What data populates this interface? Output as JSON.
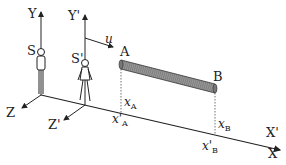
{
  "diagram": {
    "type": "relativity-frames-rod",
    "labels": {
      "Y": "Y",
      "Y_prime": "Y'",
      "S": "S",
      "S_prime": "S'",
      "u": "u",
      "A": "A",
      "B": "B",
      "Z": "Z",
      "Z_prime": "Z'",
      "X": "X",
      "X_prime": "X'",
      "xA": "x",
      "xA_sub": "A",
      "xA_prime": "x'",
      "xA_prime_sub": "A",
      "xB": "x",
      "xB_sub": "B",
      "xB_prime": "x'",
      "xB_prime_sub": "B"
    },
    "colors": {
      "line": "#222222",
      "rod": "#888888",
      "rod_dark": "#444444"
    }
  }
}
